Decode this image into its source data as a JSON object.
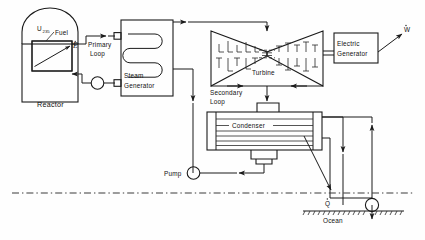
{
  "diagram": {
    "type": "process-flow-diagram",
    "canvas": {
      "width": 425,
      "height": 240
    },
    "colors": {
      "line": "#1a1a1a",
      "background": "#fefefe",
      "waterline": "#3a3a3a"
    }
  },
  "labels": {
    "fuel_symbol": "U",
    "fuel_subscript": "235",
    "fuel_word": "Fuel",
    "core_energy": "E",
    "reactor": "Reactor",
    "primary_loop_line1": "Primary",
    "primary_loop_line2": "Loop",
    "steam_generator_line1": "Steam",
    "steam_generator_line2": "Generator",
    "turbine": "Turbine",
    "secondary_loop_line1": "Secondary",
    "secondary_loop_line2": "Loop",
    "electric_generator_line1": "Electric",
    "electric_generator_line2": "Generator",
    "work_output": "W",
    "condenser": "Condenser",
    "pump": "Pump",
    "heat_rejected": "Q",
    "ocean": "Ocean"
  },
  "components": [
    {
      "name": "reactor-vessel",
      "label": "Reactor",
      "shape": "dome-topped-rectangle"
    },
    {
      "name": "reactor-core",
      "label": "U235 Fuel",
      "shape": "hatched-rectangle"
    },
    {
      "name": "primary-loop",
      "label": "Primary Loop",
      "shape": "piping"
    },
    {
      "name": "primary-pump",
      "label": "",
      "shape": "circle"
    },
    {
      "name": "steam-generator",
      "label": "Steam Generator",
      "shape": "rectangle-with-serpentine-coil"
    },
    {
      "name": "turbine",
      "label": "Turbine",
      "shape": "bowtie-with-blades"
    },
    {
      "name": "electric-generator",
      "label": "Electric Generator",
      "shape": "rectangle"
    },
    {
      "name": "condenser",
      "label": "Condenser",
      "shape": "shell-and-tube"
    },
    {
      "name": "secondary-loop",
      "label": "Secondary Loop",
      "shape": "piping"
    },
    {
      "name": "feedwater-pump",
      "label": "Pump",
      "shape": "circle"
    },
    {
      "name": "circulating-water-pump",
      "label": "",
      "shape": "circle"
    },
    {
      "name": "ocean",
      "label": "Ocean",
      "shape": "hatched-ground-line"
    },
    {
      "name": "waterline",
      "label": "",
      "shape": "dash-dot-line"
    }
  ],
  "flows": [
    {
      "name": "work-output",
      "label": "W",
      "direction": "out-upper-right"
    },
    {
      "name": "heat-rejection",
      "label": "Q",
      "direction": "down-to-ocean"
    },
    {
      "name": "core-energy",
      "label": "E",
      "direction": "in-core"
    }
  ]
}
